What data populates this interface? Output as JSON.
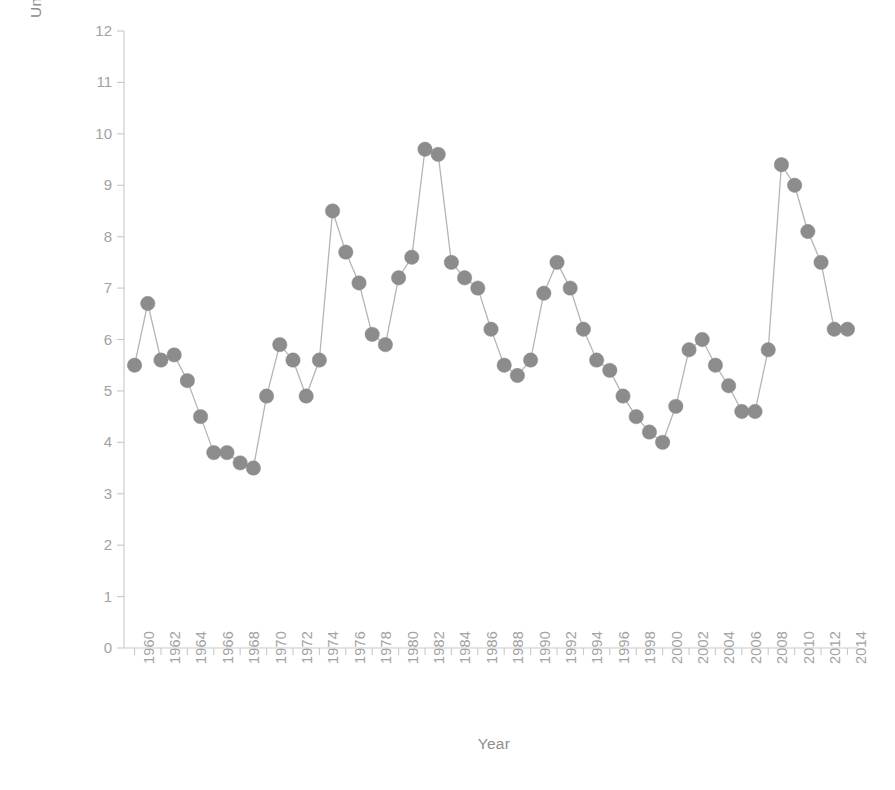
{
  "chart_data": {
    "type": "line",
    "title": "",
    "xlabel": "Year",
    "ylabel": "Unemployment Rate (%)",
    "xlim": [
      1959.2,
      2014.8
    ],
    "ylim": [
      0,
      12
    ],
    "ytick_values": [
      0,
      1,
      2,
      3,
      4,
      5,
      6,
      7,
      8,
      9,
      10,
      11,
      12
    ],
    "ytick_labels": [
      "0",
      "1",
      "2",
      "3",
      "4",
      "5",
      "6",
      "7",
      "8",
      "9",
      "10",
      "11",
      "12"
    ],
    "xtick_values": [
      1960,
      1962,
      1964,
      1966,
      1968,
      1970,
      1972,
      1974,
      1976,
      1978,
      1980,
      1982,
      1984,
      1986,
      1988,
      1990,
      1992,
      1994,
      1996,
      1998,
      2000,
      2002,
      2004,
      2006,
      2008,
      2010,
      2012,
      2014
    ],
    "xtick_labels": [
      "1960",
      "1962",
      "1964",
      "1966",
      "1968",
      "1970",
      "1972",
      "1974",
      "1976",
      "1978",
      "1980",
      "1982",
      "1984",
      "1986",
      "1988",
      "1990",
      "1992",
      "1994",
      "1996",
      "1998",
      "2000",
      "2002",
      "2004",
      "2006",
      "2008",
      "2010",
      "2012",
      "2014"
    ],
    "xtick_rotation": -90,
    "grid": false,
    "legend": false,
    "legend_position": "none",
    "marker": "circle",
    "marker_color": "#8c8c8c",
    "line_color": "#b5b5b5",
    "axis_color": "#c9c9c9",
    "text_color": "#9a9a9a",
    "series": [
      {
        "name": "Unemployment Rate",
        "x": [
          1960,
          1961,
          1962,
          1963,
          1964,
          1965,
          1966,
          1967,
          1968,
          1969,
          1970,
          1971,
          1972,
          1973,
          1974,
          1975,
          1976,
          1977,
          1978,
          1979,
          1980,
          1981,
          1982,
          1983,
          1984,
          1985,
          1986,
          1987,
          1988,
          1989,
          1990,
          1991,
          1992,
          1993,
          1994,
          1995,
          1996,
          1997,
          1998,
          1999,
          2000,
          2001,
          2002,
          2003,
          2004,
          2005,
          2006,
          2007,
          2008,
          2009,
          2010,
          2011,
          2012,
          2013,
          2014
        ],
        "values": [
          5.5,
          6.7,
          5.6,
          5.7,
          5.2,
          4.5,
          3.8,
          3.8,
          3.6,
          3.5,
          4.9,
          5.9,
          5.6,
          4.9,
          5.6,
          8.5,
          7.7,
          7.1,
          6.1,
          5.9,
          7.2,
          7.6,
          9.7,
          9.6,
          7.5,
          7.2,
          7.0,
          6.2,
          5.5,
          5.3,
          5.6,
          6.9,
          7.5,
          7.0,
          6.2,
          5.6,
          5.4,
          4.9,
          4.5,
          4.2,
          4.0,
          4.7,
          5.8,
          6.0,
          5.5,
          5.1,
          4.6,
          4.6,
          5.8,
          9.4,
          9.0,
          8.1,
          7.5,
          6.2,
          6.2
        ]
      }
    ]
  },
  "caption": {
    "text": ""
  }
}
